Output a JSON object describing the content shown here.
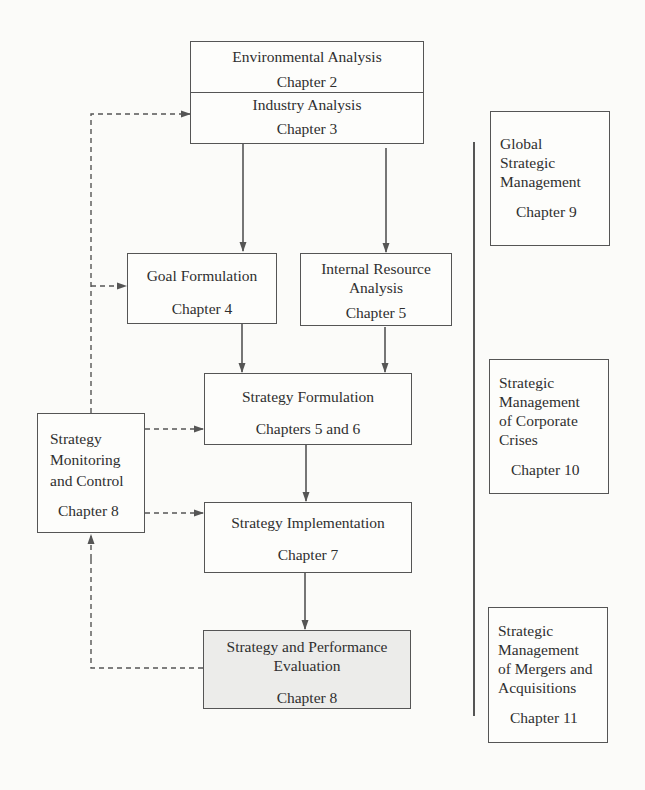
{
  "diagram": {
    "type": "strategic-management-process-flowchart",
    "main_flow": {
      "environmental_analysis": {
        "title": "Environmental Analysis",
        "chapter": "Chapter 2"
      },
      "industry_analysis": {
        "title": "Industry Analysis",
        "chapter": "Chapter 3"
      },
      "goal_formulation": {
        "title": "Goal Formulation",
        "chapter": "Chapter 4"
      },
      "internal_resource_analysis": {
        "title_line1": "Internal Resource",
        "title_line2": "Analysis",
        "chapter": "Chapter 5"
      },
      "strategy_formulation": {
        "title": "Strategy Formulation",
        "chapter": "Chapters 5 and 6"
      },
      "strategy_implementation": {
        "title": "Strategy Implementation",
        "chapter": "Chapter 7"
      },
      "strategy_evaluation": {
        "title_line1": "Strategy and Performance",
        "title_line2": "Evaluation",
        "chapter": "Chapter 8",
        "fill": "#ececea"
      }
    },
    "control": {
      "strategy_monitoring": {
        "title_line1": "Strategy",
        "title_line2": "Monitoring",
        "title_line3": "and Control",
        "chapter": "Chapter 8"
      }
    },
    "side_topics": [
      {
        "lines": [
          "Global",
          "Strategic",
          "Management"
        ],
        "chapter": "Chapter 9"
      },
      {
        "lines": [
          "Strategic",
          "Management",
          "of Corporate",
          "Crises"
        ],
        "chapter": "Chapter 10"
      },
      {
        "lines": [
          "Strategic",
          "Management",
          "of Mergers and",
          "Acquisitions"
        ],
        "chapter": "Chapter 11"
      }
    ],
    "edges": [
      {
        "from": "industry_analysis",
        "to": "goal_formulation",
        "style": "solid"
      },
      {
        "from": "industry_analysis",
        "to": "internal_resource_analysis",
        "style": "solid"
      },
      {
        "from": "goal_formulation",
        "to": "strategy_formulation",
        "style": "solid"
      },
      {
        "from": "internal_resource_analysis",
        "to": "strategy_formulation",
        "style": "solid"
      },
      {
        "from": "strategy_formulation",
        "to": "strategy_implementation",
        "style": "solid"
      },
      {
        "from": "strategy_implementation",
        "to": "strategy_evaluation",
        "style": "solid"
      },
      {
        "from": "strategy_evaluation",
        "to": "strategy_monitoring",
        "style": "dashed"
      },
      {
        "from": "strategy_monitoring",
        "to": "industry_analysis",
        "style": "dashed"
      },
      {
        "from": "strategy_monitoring",
        "to": "goal_formulation",
        "style": "dashed"
      },
      {
        "from": "strategy_monitoring",
        "to": "strategy_formulation",
        "style": "dashed"
      },
      {
        "from": "strategy_monitoring",
        "to": "strategy_implementation",
        "style": "dashed"
      }
    ],
    "colors": {
      "line": "#555555",
      "box_fill": "#fdfdfb",
      "shaded_fill": "#ececea",
      "background": "#fbfbf9"
    }
  }
}
